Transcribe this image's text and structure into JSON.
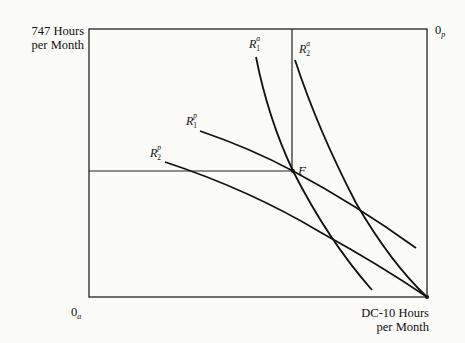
{
  "diagram": {
    "type": "edgeworth-box",
    "y_axis_label_line1": "747 Hours",
    "y_axis_label_line2": "per Month",
    "x_axis_label_line1": "DC-10 Hours",
    "x_axis_label_line2": "per Month",
    "origin_bottom_left": {
      "main": "0",
      "sub": "a"
    },
    "origin_top_right": {
      "main": "0",
      "sub": "p"
    },
    "point_label": "F",
    "curves": [
      {
        "id": "R1a",
        "base": "R",
        "sup": "a",
        "sub": "1"
      },
      {
        "id": "R2a",
        "base": "R",
        "sup": "a",
        "sub": "2"
      },
      {
        "id": "R1p",
        "base": "R",
        "sup": "p",
        "sub": "1"
      },
      {
        "id": "R2p",
        "base": "R",
        "sup": "p",
        "sub": "2"
      }
    ],
    "colors": {
      "line": "#111111",
      "background": "#fbfbf7"
    }
  }
}
